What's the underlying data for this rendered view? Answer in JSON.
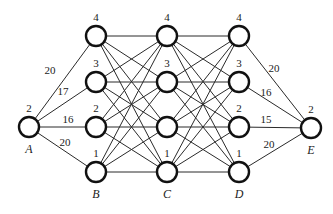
{
  "diagram": {
    "type": "layered-graph",
    "colors": {
      "edge": "#2a2a2a",
      "node_stroke": "#111111",
      "background": "#ffffff"
    },
    "source": {
      "id": "A",
      "name": "A",
      "value": "2",
      "x": 29,
      "y": 127
    },
    "sink": {
      "id": "E",
      "name": "E",
      "value": "2",
      "x": 311,
      "y": 128
    },
    "stages": [
      {
        "name": "B",
        "x": 96,
        "nodes": [
          {
            "id": "B4",
            "value": "4",
            "y": 36
          },
          {
            "id": "B3",
            "value": "3",
            "y": 82
          },
          {
            "id": "B2",
            "value": "2",
            "y": 127
          },
          {
            "id": "B1",
            "value": "1",
            "y": 172
          }
        ]
      },
      {
        "name": "C",
        "x": 167,
        "nodes": [
          {
            "id": "C4",
            "value": "4",
            "y": 36
          },
          {
            "id": "C3",
            "value": "3",
            "y": 82
          },
          {
            "id": "C2",
            "value": "",
            "y": 127
          },
          {
            "id": "C1",
            "value": "1",
            "y": 172
          }
        ]
      },
      {
        "name": "D",
        "x": 239,
        "nodes": [
          {
            "id": "D4",
            "value": "4",
            "y": 36
          },
          {
            "id": "D3",
            "value": "3",
            "y": 82
          },
          {
            "id": "D2",
            "value": "2",
            "y": 127
          },
          {
            "id": "D1",
            "value": "1",
            "y": 172
          }
        ]
      }
    ],
    "source_edges": [
      {
        "to": "B4",
        "weight": "20",
        "lx": 50,
        "ly": 74
      },
      {
        "to": "B3",
        "weight": "17",
        "lx": 63,
        "ly": 95
      },
      {
        "to": "B2",
        "weight": "16",
        "lx": 68,
        "ly": 123
      },
      {
        "to": "B1",
        "weight": "20",
        "lx": 65,
        "ly": 146
      }
    ],
    "sink_edges": [
      {
        "from": "D4",
        "weight": "20",
        "lx": 274,
        "ly": 72
      },
      {
        "from": "D3",
        "weight": "16",
        "lx": 266,
        "ly": 96
      },
      {
        "from": "D2",
        "weight": "15",
        "lx": 266,
        "ly": 123
      },
      {
        "from": "D1",
        "weight": "20",
        "lx": 269,
        "ly": 148
      }
    ],
    "node_radius": 10
  }
}
